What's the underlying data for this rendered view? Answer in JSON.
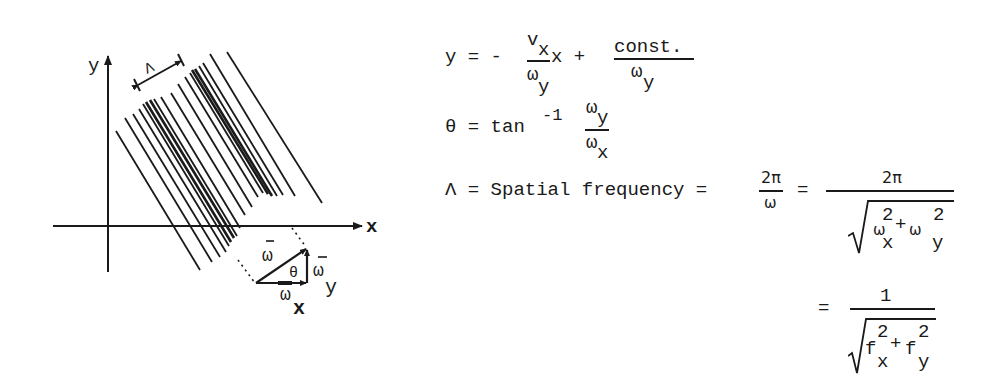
{
  "diagram": {
    "axis_x_label": "x",
    "axis_y_label": "y",
    "wavelength_label": "Λ",
    "vector_omega_label": "ω",
    "vector_omega_x_label": "ω",
    "vector_omega_x_sub": "x",
    "vector_omega_y_label": "ω",
    "vector_omega_y_sub": "y",
    "angle_label": "θ",
    "colors": {
      "ink": "#1a1a1a",
      "background": "#ffffff"
    }
  },
  "equations": {
    "eq1": {
      "lhs": "y = -",
      "num_main": "v",
      "num_sub": "x",
      "den_main": "ω",
      "den_sub": "y",
      "mid": "x +",
      "num2": "const.",
      "den2_main": "ω",
      "den2_sub": "y"
    },
    "eq2": {
      "lhs": "θ = tan",
      "sup": "-1",
      "num_main": "ω",
      "num_sub": "y",
      "den_main": "ω",
      "den_sub": "x"
    },
    "eq3": {
      "lhs": "Λ = Spatial frequency =",
      "frac1_num": "2π",
      "frac1_den": "ω",
      "eq": "=",
      "frac2_num": "2π",
      "rad_a": "ω",
      "rad_a_sup": "2",
      "rad_a_sub": "x",
      "plus": "+",
      "rad_b": "ω",
      "rad_b_sup": "2",
      "rad_b_sub": "y"
    },
    "eq4": {
      "eq": "=",
      "num": "1",
      "rad_a": "f",
      "rad_a_sup": "2",
      "rad_a_sub": "x",
      "plus": "+",
      "rad_b": "f",
      "rad_b_sup": "2",
      "rad_b_sub": "y"
    }
  }
}
